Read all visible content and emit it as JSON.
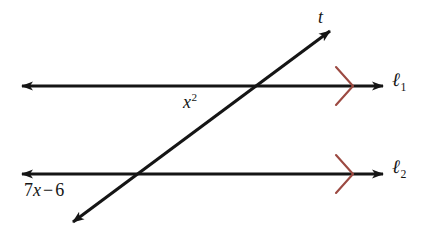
{
  "figure": {
    "kind": "geometry-diagram",
    "background_color": "#ffffff",
    "line_color": "#151515",
    "mark_color": "#9c4a42",
    "width": 427,
    "height": 247
  },
  "labels": {
    "transversal": "t",
    "line_1_base": "ℓ",
    "line_1_sub": "1",
    "line_2_base": "ℓ",
    "line_2_sub": "2",
    "angle_upper_base": "x",
    "angle_upper_exp": "2",
    "angle_lower_coefficient": "7",
    "angle_lower_variable": "x",
    "angle_lower_operator": "−",
    "angle_lower_constant": "6",
    "angle_lower_full": "7x − 6"
  },
  "geometry": {
    "line_1": {
      "y": 86,
      "x_start": 22,
      "x_end": 383,
      "arrows": "both"
    },
    "line_2": {
      "y": 174,
      "x_start": 22,
      "x_end": 383,
      "arrows": "both"
    },
    "transversal": {
      "x_start": 73,
      "y_start": 222,
      "x_end": 330,
      "y_end": 31,
      "arrows": "both"
    },
    "intersection_upper": {
      "x": 256,
      "y": 86
    },
    "intersection_lower": {
      "x": 141,
      "y": 174
    },
    "parallel_mark_upper": {
      "x": 345,
      "y": 86
    },
    "parallel_mark_lower": {
      "x": 345,
      "y": 174
    }
  }
}
